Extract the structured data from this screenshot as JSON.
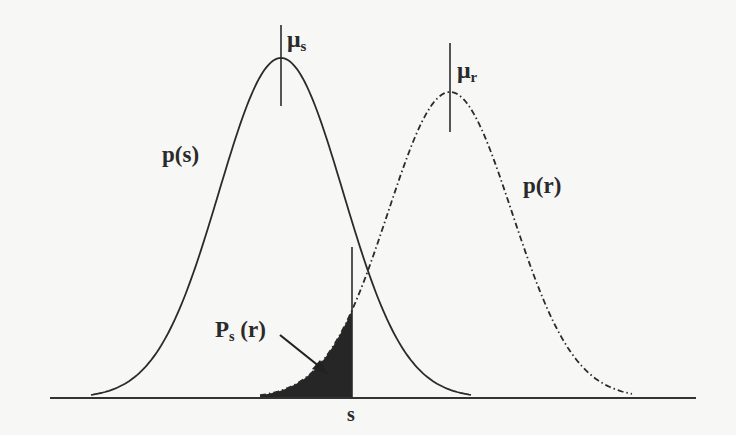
{
  "figure": {
    "type": "overlapping-distributions",
    "labels": {
      "mu_s": {
        "base": "μ",
        "sub": "s"
      },
      "mu_r": {
        "base": "μ",
        "sub": "r"
      },
      "p_s": "p(s)",
      "p_r": "p(r)",
      "P_s_r": {
        "base": "P",
        "sub": "s",
        "rest": " (r)"
      },
      "s_marker": "s"
    },
    "curves": [
      {
        "name": "p(s)",
        "style": "solid",
        "peak_x": 281,
        "peak_y": 58,
        "sigma_px": 62
      },
      {
        "name": "p(r)",
        "style": "dash-dot",
        "peak_x": 450,
        "peak_y": 92,
        "sigma_px": 62
      }
    ],
    "baseline": {
      "x1": 50,
      "x2": 696,
      "y": 398
    },
    "s_line_x": 352,
    "shaded_region": "area under p(r) left of s",
    "colors": {
      "ink": "#2b2b2b",
      "fill": "#262626",
      "paper": "#f7f7f5"
    }
  }
}
